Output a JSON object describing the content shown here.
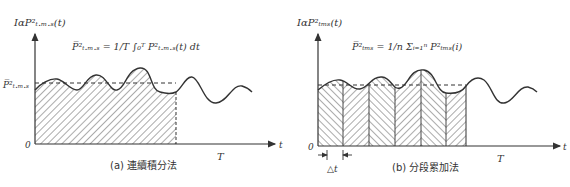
{
  "panels": [
    {
      "id": "a",
      "y_axis_label": "IαP²ₜ.ₘ.ₛ(t)",
      "formula": "P̅²ₜ.ₘ.ₛ = 1/T ∫₀ᵀ P²ₜ.ₘ.ₛ(t) dt",
      "mean_label": "P̅²ₜ.ₘ.ₛ",
      "origin_label": "0",
      "x_axis_label": "t",
      "period_label": "T",
      "caption": "(a) 連續積分法"
    },
    {
      "id": "b",
      "y_axis_label": "IαP²ₜₘₛ(t)",
      "formula": "P̅²ₜₘₛ = 1/n Σᵢ₌₁ⁿ P²ₜₘₛ(i)",
      "origin_label": "0",
      "x_axis_label": "t",
      "period_label": "T",
      "delta_label": "△t",
      "caption": "(b) 分段累加法"
    }
  ],
  "colors": {
    "stroke": "#333333",
    "background": "#ffffff"
  }
}
